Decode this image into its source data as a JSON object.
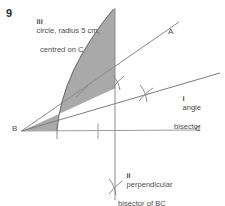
{
  "figure": {
    "question_number": "9",
    "labels": {
      "point_a": "A",
      "point_b": "B",
      "point_c": "C"
    },
    "annotations": {
      "circle": {
        "roman": "iii",
        "line1": "circle, radius 5 cm,",
        "line2": "centred on C"
      },
      "angle_bisector": {
        "roman": "i",
        "line1": "angle",
        "line2": "bisector"
      },
      "perpendicular_bisector": {
        "roman": "ii",
        "line1": "perpendicular",
        "line2": "bisector of BC"
      }
    },
    "colors": {
      "shaded_region": "#a9a9a9",
      "construction_line": "#8c8c8c",
      "axis_line": "#9a9a9a",
      "arc_line": "#707070",
      "text": "#4d4d4d",
      "number": "#2b2b2b",
      "background": "#ffffff"
    },
    "geometry": {
      "point_b": [
        22,
        131
      ],
      "point_c": [
        198,
        130
      ],
      "ray_ba_end": [
        178,
        24
      ],
      "ray_bisector_end": [
        219,
        74
      ],
      "perp_bisector_x": 115,
      "perp_bisector_top_y": 8,
      "perp_bisector_bottom_y": 200,
      "arc_start": [
        57,
        130
      ],
      "arc_end": [
        114,
        9
      ],
      "ticks_on_bc_x": [
        57,
        98
      ],
      "tick_on_ba": [
        82,
        92
      ],
      "crosses": [
        [
          119,
          82
        ],
        [
          146,
          94
        ],
        [
          115,
          186
        ]
      ]
    }
  }
}
